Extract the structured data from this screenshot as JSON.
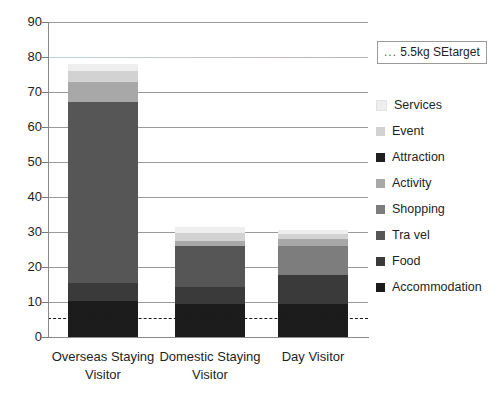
{
  "chart_data": {
    "type": "bar",
    "subtype": "stacked-column",
    "title": "",
    "xlabel": "",
    "ylabel": "",
    "ylim": [
      0,
      90
    ],
    "ytick_step": 10,
    "yticks": [
      0,
      10,
      20,
      30,
      40,
      50,
      60,
      70,
      80,
      90
    ],
    "grid": true,
    "grid_axis": "y",
    "legend_position": "right",
    "categories": [
      "Overseas Staying Visitor",
      "Domestic Staying Visitor",
      "Day Visitor"
    ],
    "series": [
      {
        "name": "Accommodation",
        "color": "#1c1c1c",
        "values": [
          10.2,
          9.3,
          9.3
        ]
      },
      {
        "name": "Food",
        "color": "#3a3a3a",
        "values": [
          5.2,
          5.0,
          8.5
        ]
      },
      {
        "name": "Tra vel",
        "color": "#565656",
        "values": [
          51.8,
          11.8,
          0.0
        ]
      },
      {
        "name": "Shopping",
        "color": "#7d7d7d",
        "values": [
          0.0,
          0.0,
          8.2
        ]
      },
      {
        "name": "Activity",
        "color": "#a8a8a8",
        "values": [
          5.8,
          1.3,
          2.0
        ]
      },
      {
        "name": "Attraction",
        "color": "#1f1f1f",
        "values": [
          0.0,
          0.0,
          0.0
        ]
      },
      {
        "name": "Event",
        "color": "#d2d2d2",
        "values": [
          3.0,
          2.3,
          1.5
        ]
      },
      {
        "name": "Services",
        "color": "#eeeeee",
        "values": [
          2.0,
          1.8,
          1.0
        ]
      }
    ],
    "totals": [
      78.0,
      31.5,
      30.5
    ],
    "reference_line": {
      "label": "... 5.5kg SEtarget",
      "dots": "...",
      "text": "5.5kg SEtarget",
      "value": 5.5,
      "style": "dashed",
      "color": "#1a1a1a"
    }
  },
  "axis": {
    "y_labels": [
      "90",
      "80",
      "70",
      "60",
      "50",
      "40",
      "30",
      "20",
      "10",
      "0"
    ]
  },
  "legend": {
    "items": [
      {
        "label": "Services",
        "color": "#eeeeee"
      },
      {
        "label": "Event",
        "color": "#d2d2d2"
      },
      {
        "label": "Attraction",
        "color": "#1f1f1f"
      },
      {
        "label": "Activity",
        "color": "#a8a8a8"
      },
      {
        "label": "Shopping",
        "color": "#7d7d7d"
      },
      {
        "label": "Tra vel",
        "color": "#565656"
      },
      {
        "label": "Food",
        "color": "#3a3a3a"
      },
      {
        "label": "Accommodation",
        "color": "#1c1c1c"
      }
    ]
  },
  "categories_labels": [
    {
      "line1": "Overseas Staying",
      "line2": "Visitor"
    },
    {
      "line1": "Domestic Staying",
      "line2": "Visitor"
    },
    {
      "line1": "Day Visitor",
      "line2": ""
    }
  ]
}
